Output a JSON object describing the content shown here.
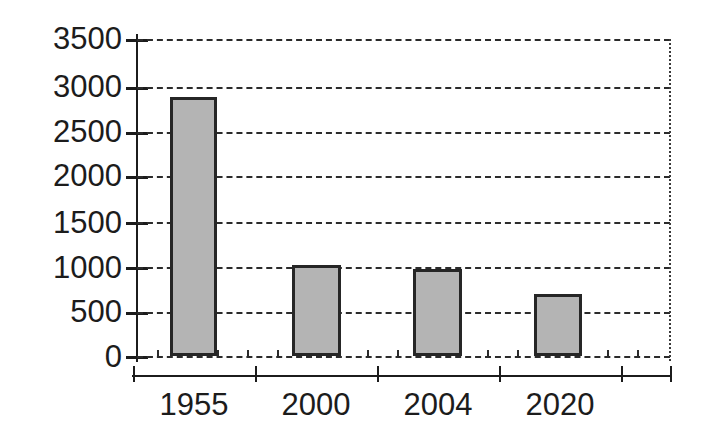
{
  "chart_data": {
    "type": "bar",
    "title": "",
    "subtitle": "",
    "xlabel": "",
    "ylabel": "",
    "categories": [
      "1955",
      "2000",
      "2004",
      "2020"
    ],
    "values": [
      2860,
      1000,
      960,
      690
    ],
    "series": [
      {
        "name": "",
        "values": [
          2860,
          1000,
          960,
          690
        ]
      }
    ],
    "ylim": [
      0,
      3500
    ],
    "yticks": [
      0,
      500,
      1000,
      1500,
      2000,
      2500,
      3000,
      3500
    ],
    "ytick_labels": [
      "0",
      "500",
      "1000",
      "1500",
      "2000",
      "2500",
      "3000",
      "3500"
    ],
    "grid": true,
    "grid_style": "dashed-horizontal",
    "legend": false,
    "legend_position": "none",
    "annotations": [],
    "bar_fill_color": "#b4b4b4",
    "bar_border_color": "#262626",
    "axis_color": "#1c1c1c",
    "grid_color": "#2b2b2b",
    "background_color": "#ffffff"
  },
  "axes": {
    "y": {
      "ticks": [
        {
          "label": "3500",
          "value": 3500
        },
        {
          "label": "3000",
          "value": 3000
        },
        {
          "label": "2500",
          "value": 2500
        },
        {
          "label": "2000",
          "value": 2000
        },
        {
          "label": "1500",
          "value": 1500
        },
        {
          "label": "1000",
          "value": 1000
        },
        {
          "label": "500",
          "value": 500
        },
        {
          "label": "0",
          "value": 0
        }
      ]
    },
    "x": {
      "ticks": [
        {
          "label": "1955"
        },
        {
          "label": "2000"
        },
        {
          "label": "2004"
        },
        {
          "label": "2020"
        }
      ]
    }
  }
}
